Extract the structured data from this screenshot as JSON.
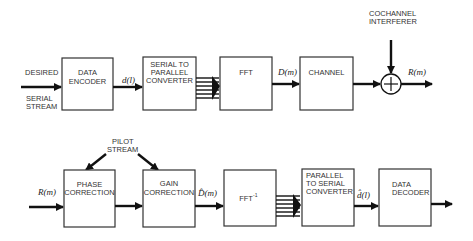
{
  "diagram": {
    "top_row": {
      "input_label_1": "DESIRED",
      "input_label_2a": "SERIAL",
      "input_label_2b": "STREAM",
      "blocks": [
        {
          "id": "data-encoder",
          "lines": [
            "DATA",
            "ENCODER"
          ]
        },
        {
          "id": "serial-to-parallel",
          "lines": [
            "SERIAL TO",
            "PARALLEL",
            "CONVERTER"
          ]
        },
        {
          "id": "fft",
          "lines": [
            "FFT"
          ]
        },
        {
          "id": "channel",
          "lines": [
            "CHANNEL"
          ]
        }
      ],
      "signals": {
        "encoder_out": "d(l)",
        "fft_out": "D(m)",
        "sum_out": "R(m)"
      },
      "interferer_label_1": "COCHANNEL",
      "interferer_label_2": "INTERFERER",
      "summer_symbol": "+"
    },
    "bottom_row": {
      "input_signal": "R(m)",
      "pilot_label_1": "PILOT",
      "pilot_label_2": "STREAM",
      "blocks": [
        {
          "id": "phase-correction",
          "lines": [
            "PHASE",
            "CORRECTION"
          ]
        },
        {
          "id": "gain-correction",
          "lines": [
            "GAIN",
            "CORRECTION"
          ]
        },
        {
          "id": "ifft",
          "lines": [
            "FFT"
          ],
          "superscript": "-1"
        },
        {
          "id": "parallel-to-serial",
          "lines": [
            "PARALLEL",
            "TO SERIAL",
            "CONVERTER"
          ]
        },
        {
          "id": "data-decoder",
          "lines": [
            "DATA",
            "DECODER"
          ]
        }
      ],
      "signals": {
        "gain_out": "D̂(m)",
        "p2s_out": "d̂(l)"
      }
    }
  }
}
